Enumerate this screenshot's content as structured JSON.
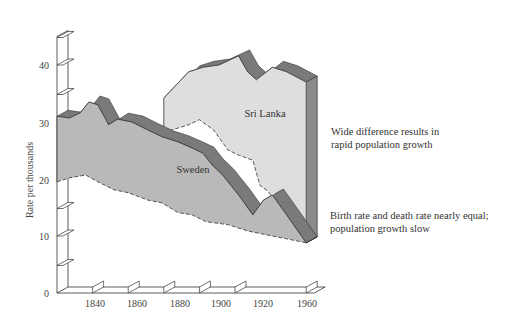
{
  "chart_data": {
    "type": "area",
    "title": "",
    "xlabel": "",
    "ylabel": "Rate per thousands",
    "xlim": [
      1820,
      1960
    ],
    "ylim": [
      0,
      45
    ],
    "x_ticks": [
      1840,
      1860,
      1880,
      1900,
      1920,
      1960
    ],
    "y_ticks": [
      0,
      10,
      20,
      30,
      40
    ],
    "grid": false,
    "style": "3d ribbon area",
    "series": [
      {
        "name": "Sweden",
        "label": "Sweden",
        "birth_rate": {
          "x": [
            1820,
            1827,
            1833,
            1838,
            1843,
            1849,
            1854,
            1862,
            1871,
            1879,
            1888,
            1896,
            1902,
            1907,
            1913,
            1922,
            1930,
            1936,
            1941,
            1949,
            1960
          ],
          "values": [
            31,
            30.7,
            31.6,
            33.5,
            33,
            29.5,
            30.5,
            30,
            28.6,
            27.4,
            26.5,
            25.4,
            24.5,
            22.5,
            20.7,
            17.2,
            13.7,
            16.3,
            17.2,
            13.7,
            8.8
          ]
        },
        "death_rate": {
          "x": [
            1820,
            1827,
            1836,
            1843,
            1852,
            1860,
            1871,
            1879,
            1888,
            1896,
            1904,
            1916,
            1927,
            1938,
            1949,
            1960
          ],
          "values": [
            19.5,
            20.2,
            20.7,
            19.5,
            18.1,
            17.6,
            16.3,
            15.8,
            14.1,
            13.7,
            12.5,
            12,
            10.9,
            10.2,
            9.5,
            8.8
          ]
        },
        "fill": "#b8b8b8",
        "top_face": "#777777"
      },
      {
        "name": "Sri Lanka",
        "label": "Sri Lanka",
        "birth_rate": {
          "x": [
            1880,
            1894,
            1902,
            1911,
            1922,
            1927,
            1932,
            1941,
            1949,
            1960
          ],
          "values": [
            34.2,
            38.8,
            39.6,
            40,
            41.6,
            38.8,
            37.4,
            39.6,
            38.8,
            37
          ]
        },
        "death_rate": {
          "x": [
            1880,
            1894,
            1900,
            1908,
            1916,
            1922,
            1930,
            1934,
            1938,
            1947,
            1955,
            1960
          ],
          "values": [
            28.2,
            29.5,
            30.4,
            28.6,
            25.1,
            24.2,
            23.3,
            18.9,
            18,
            14.8,
            10.9,
            8.8
          ]
        },
        "fill": "#dcdcdc",
        "top_face": "#777777"
      }
    ],
    "annotations": [
      {
        "text": "Wide difference results in rapid population growth",
        "near": "Sri Lanka 1960"
      },
      {
        "text": "Birth rate and death rate nearly equal; population growth slow",
        "near": "Sweden 1960"
      }
    ]
  },
  "labels": {
    "y_axis_title": "Rate per thousands",
    "y_ticks": [
      "0",
      "10",
      "20",
      "30",
      "40"
    ],
    "x_ticks": [
      "1840",
      "1860",
      "1880",
      "1900",
      "1920",
      "1960"
    ],
    "sweden": "Sweden",
    "sri_lanka": "Sri Lanka",
    "annotation_1_line1": "Wide difference results in",
    "annotation_1_line2": "rapid population growth",
    "annotation_2_line1": "Birth rate and death rate nearly equal;",
    "annotation_2_line2": "population growth slow"
  },
  "colors": {
    "sweden_fill": "#b9b9b9",
    "sri_lanka_fill": "#dedede",
    "ribbon_top": "#7a7a7a",
    "side_face": "#8a8a8a",
    "axis": "#333333"
  }
}
